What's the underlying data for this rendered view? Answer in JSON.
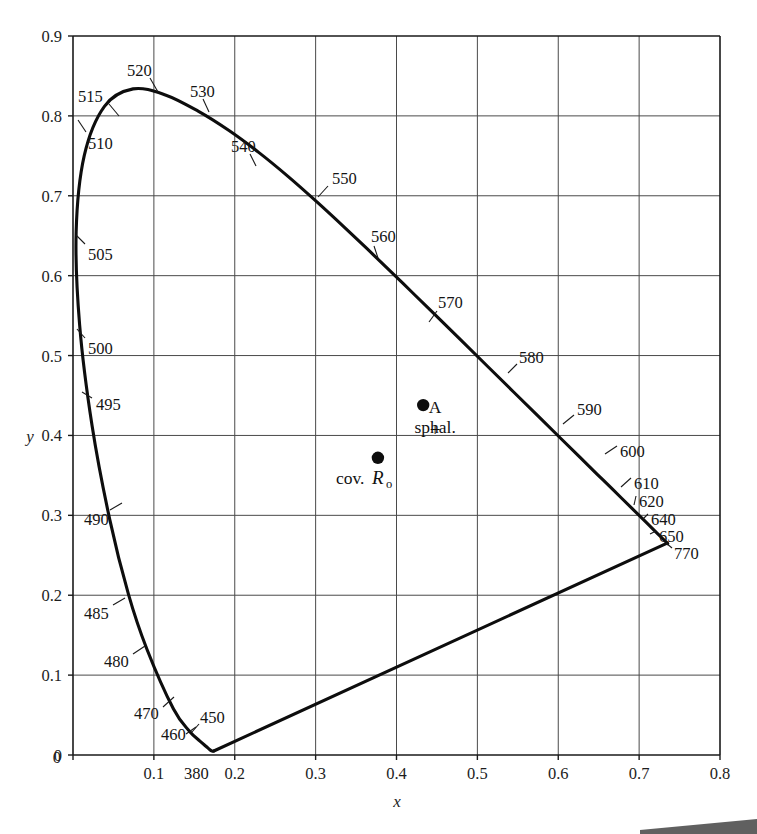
{
  "figure": {
    "kind": "cie-1931-chromaticity-diagram",
    "background_color": "#ffffff",
    "ink_color": "#0d0d0d",
    "grid_color": "#4a4a4a"
  },
  "axes": {
    "x_title": "x",
    "y_title": "y",
    "x_ticks": [
      "0",
      "0.1",
      "0.2",
      "0.3",
      "0.4",
      "0.5",
      "0.6",
      "0.7",
      "0.8"
    ],
    "x_tick_values": [
      0,
      0.1,
      0.2,
      0.3,
      0.4,
      0.5,
      0.6,
      0.7,
      0.8
    ],
    "y_ticks": [
      "0",
      "0.1",
      "0.2",
      "0.3",
      "0.4",
      "0.5",
      "0.6",
      "0.7",
      "0.8",
      "0.9"
    ],
    "y_tick_values": [
      0,
      0.1,
      0.2,
      0.3,
      0.4,
      0.5,
      0.6,
      0.7,
      0.8,
      0.9
    ],
    "x_origin_label": "0",
    "y_origin_label": "0",
    "xlim": [
      0,
      0.8
    ],
    "ylim": [
      0,
      0.9
    ],
    "grid": true
  },
  "chart_data": {
    "type": "line",
    "title": "",
    "subtitle": "",
    "xlabel": "x",
    "ylabel": "y",
    "xlim": [
      0,
      0.8
    ],
    "ylim": [
      0,
      0.9
    ],
    "grid": true,
    "legend_position": "none",
    "series": [
      {
        "name": "spectral-locus",
        "note": "CIE 1931 spectral locus, 380 nm to 770 nm",
        "points": [
          {
            "wavelength": 380,
            "x": 0.1741,
            "y": 0.005
          },
          {
            "wavelength": 390,
            "x": 0.1738,
            "y": 0.0049
          },
          {
            "wavelength": 400,
            "x": 0.1733,
            "y": 0.0048
          },
          {
            "wavelength": 410,
            "x": 0.1726,
            "y": 0.0048
          },
          {
            "wavelength": 420,
            "x": 0.1714,
            "y": 0.0051
          },
          {
            "wavelength": 430,
            "x": 0.1689,
            "y": 0.0069
          },
          {
            "wavelength": 440,
            "x": 0.1644,
            "y": 0.0109
          },
          {
            "wavelength": 450,
            "x": 0.1566,
            "y": 0.0177
          },
          {
            "wavelength": 460,
            "x": 0.144,
            "y": 0.0297
          },
          {
            "wavelength": 470,
            "x": 0.1241,
            "y": 0.0578
          },
          {
            "wavelength": 480,
            "x": 0.0913,
            "y": 0.1327
          },
          {
            "wavelength": 485,
            "x": 0.0687,
            "y": 0.2007
          },
          {
            "wavelength": 490,
            "x": 0.0454,
            "y": 0.295
          },
          {
            "wavelength": 495,
            "x": 0.0235,
            "y": 0.4127
          },
          {
            "wavelength": 500,
            "x": 0.0082,
            "y": 0.5384
          },
          {
            "wavelength": 505,
            "x": 0.0039,
            "y": 0.6548
          },
          {
            "wavelength": 510,
            "x": 0.0139,
            "y": 0.7502
          },
          {
            "wavelength": 515,
            "x": 0.0389,
            "y": 0.812
          },
          {
            "wavelength": 520,
            "x": 0.0743,
            "y": 0.8338
          },
          {
            "wavelength": 525,
            "x": 0.1142,
            "y": 0.8262
          },
          {
            "wavelength": 530,
            "x": 0.1547,
            "y": 0.8059
          },
          {
            "wavelength": 535,
            "x": 0.1929,
            "y": 0.7816
          },
          {
            "wavelength": 540,
            "x": 0.2296,
            "y": 0.7543
          },
          {
            "wavelength": 545,
            "x": 0.2658,
            "y": 0.7243
          },
          {
            "wavelength": 550,
            "x": 0.3016,
            "y": 0.6923
          },
          {
            "wavelength": 555,
            "x": 0.3373,
            "y": 0.6589
          },
          {
            "wavelength": 560,
            "x": 0.3731,
            "y": 0.6245
          },
          {
            "wavelength": 565,
            "x": 0.4087,
            "y": 0.5896
          },
          {
            "wavelength": 570,
            "x": 0.4441,
            "y": 0.5547
          },
          {
            "wavelength": 575,
            "x": 0.4788,
            "y": 0.5202
          },
          {
            "wavelength": 580,
            "x": 0.5125,
            "y": 0.4866
          },
          {
            "wavelength": 585,
            "x": 0.5448,
            "y": 0.4544
          },
          {
            "wavelength": 590,
            "x": 0.5752,
            "y": 0.4242
          },
          {
            "wavelength": 595,
            "x": 0.6029,
            "y": 0.3965
          },
          {
            "wavelength": 600,
            "x": 0.627,
            "y": 0.3725
          },
          {
            "wavelength": 605,
            "x": 0.6482,
            "y": 0.3514
          },
          {
            "wavelength": 610,
            "x": 0.6658,
            "y": 0.334
          },
          {
            "wavelength": 620,
            "x": 0.6915,
            "y": 0.3083
          },
          {
            "wavelength": 630,
            "x": 0.7079,
            "y": 0.292
          },
          {
            "wavelength": 640,
            "x": 0.719,
            "y": 0.2809
          },
          {
            "wavelength": 650,
            "x": 0.726,
            "y": 0.274
          },
          {
            "wavelength": 700,
            "x": 0.7347,
            "y": 0.2653
          },
          {
            "wavelength": 770,
            "x": 0.7347,
            "y": 0.2653
          }
        ]
      },
      {
        "name": "purple-line",
        "note": "line of purples, 770 nm back to 380 nm",
        "points": [
          {
            "x": 0.7347,
            "y": 0.2653
          },
          {
            "x": 0.1741,
            "y": 0.005
          }
        ]
      }
    ],
    "annotations": [
      {
        "label": "380",
        "x": 0.1741,
        "y": 0.005
      },
      {
        "label": "450",
        "x": 0.1566,
        "y": 0.0177
      },
      {
        "label": "460",
        "x": 0.144,
        "y": 0.0297
      },
      {
        "label": "470",
        "x": 0.1241,
        "y": 0.0578
      },
      {
        "label": "480",
        "x": 0.0913,
        "y": 0.1327
      },
      {
        "label": "485",
        "x": 0.0687,
        "y": 0.2007
      },
      {
        "label": "490",
        "x": 0.0454,
        "y": 0.295
      },
      {
        "label": "495",
        "x": 0.0235,
        "y": 0.4127
      },
      {
        "label": "500",
        "x": 0.0082,
        "y": 0.5384
      },
      {
        "label": "505",
        "x": 0.0039,
        "y": 0.6548
      },
      {
        "label": "510",
        "x": 0.0139,
        "y": 0.7502
      },
      {
        "label": "515",
        "x": 0.0389,
        "y": 0.812
      },
      {
        "label": "520",
        "x": 0.0743,
        "y": 0.8338
      },
      {
        "label": "530",
        "x": 0.1547,
        "y": 0.8059
      },
      {
        "label": "540",
        "x": 0.2296,
        "y": 0.7543
      },
      {
        "label": "550",
        "x": 0.3016,
        "y": 0.6923
      },
      {
        "label": "560",
        "x": 0.3731,
        "y": 0.6245
      },
      {
        "label": "570",
        "x": 0.4441,
        "y": 0.5547
      },
      {
        "label": "580",
        "x": 0.5125,
        "y": 0.4866
      },
      {
        "label": "590",
        "x": 0.5752,
        "y": 0.4242
      },
      {
        "label": "600",
        "x": 0.627,
        "y": 0.3725
      },
      {
        "label": "610",
        "x": 0.6658,
        "y": 0.334
      },
      {
        "label": "620",
        "x": 0.6915,
        "y": 0.3083
      },
      {
        "label": "640",
        "x": 0.719,
        "y": 0.2809
      },
      {
        "label": "650",
        "x": 0.726,
        "y": 0.274
      },
      {
        "label": "770",
        "x": 0.7347,
        "y": 0.2653
      }
    ],
    "data_points": [
      {
        "id": "illuminant-a",
        "label": "A",
        "marker": "plus",
        "x": 0.4476,
        "y": 0.4075
      },
      {
        "id": "sphalerite",
        "label": "sphal.",
        "marker": "dot",
        "x": 0.433,
        "y": 0.438
      },
      {
        "id": "covellite-ro",
        "label_prefix": "cov.",
        "label_italic": "R",
        "label_sub": "o",
        "marker": "dot",
        "x": 0.377,
        "y": 0.372
      }
    ]
  },
  "wavelength_labels": [
    {
      "text": "520",
      "lx": 127,
      "ly": 70,
      "l1x": 150,
      "l1y": 78,
      "l2x": 158,
      "l2y": 92
    },
    {
      "text": "515",
      "lx": 78,
      "ly": 96,
      "l1x": 109,
      "l1y": 104,
      "l2x": 119,
      "l2y": 116
    },
    {
      "text": "530",
      "lx": 190,
      "ly": 91,
      "l1x": 203,
      "l1y": 99,
      "l2x": 209,
      "l2y": 112
    },
    {
      "text": "510",
      "lx": 88,
      "ly": 143,
      "l1x": 86,
      "l1y": 132,
      "l2x": 78,
      "l2y": 120
    },
    {
      "text": "540",
      "lx": 231,
      "ly": 146,
      "l1x": 250,
      "l1y": 154,
      "l2x": 256,
      "l2y": 166
    },
    {
      "text": "550",
      "lx": 332,
      "ly": 178,
      "l1x": 328,
      "l1y": 186,
      "l2x": 318,
      "l2y": 197
    },
    {
      "text": "505",
      "lx": 88,
      "ly": 254,
      "l1x": 85,
      "l1y": 244,
      "l2x": 76,
      "l2y": 235
    },
    {
      "text": "560",
      "lx": 371,
      "ly": 236,
      "l1x": 374,
      "l1y": 246,
      "l2x": 378,
      "l2y": 258
    },
    {
      "text": "500",
      "lx": 88,
      "ly": 348,
      "l1x": 85,
      "l1y": 338,
      "l2x": 77,
      "l2y": 329
    },
    {
      "text": "570",
      "lx": 438,
      "ly": 302,
      "l1x": 437,
      "l1y": 311,
      "l2x": 429,
      "l2y": 322
    },
    {
      "text": "580",
      "lx": 519,
      "ly": 357,
      "l1x": 517,
      "l1y": 364,
      "l2x": 508,
      "l2y": 373
    },
    {
      "text": "495",
      "lx": 96,
      "ly": 404,
      "l1x": 92,
      "l1y": 398,
      "l2x": 82,
      "l2y": 392
    },
    {
      "text": "590",
      "lx": 577,
      "ly": 409,
      "l1x": 574,
      "l1y": 415,
      "l2x": 563,
      "l2y": 424
    },
    {
      "text": "600",
      "lx": 620,
      "ly": 451,
      "l1x": 617,
      "l1y": 446,
      "l2x": 605,
      "l2y": 454
    },
    {
      "text": "490",
      "lx": 84,
      "ly": 519,
      "l1x": 110,
      "l1y": 510,
      "l2x": 122,
      "l2y": 503
    },
    {
      "text": "610",
      "lx": 634,
      "ly": 483,
      "l1x": 631,
      "l1y": 478,
      "l2x": 621,
      "l2y": 487
    },
    {
      "text": "620",
      "lx": 639,
      "ly": 501,
      "l1x": 636,
      "l1y": 496,
      "l2x": 634,
      "l2y": 505
    },
    {
      "text": "640",
      "lx": 651,
      "ly": 519,
      "l1x": 648,
      "l1y": 514,
      "l2x": 643,
      "l2y": 519
    },
    {
      "text": "650",
      "lx": 659,
      "ly": 536,
      "l1x": 656,
      "l1y": 531,
      "l2x": 650,
      "l2y": 534
    },
    {
      "text": "485",
      "lx": 84,
      "ly": 613,
      "l1x": 113,
      "l1y": 605,
      "l2x": 125,
      "l2y": 598
    },
    {
      "text": "770",
      "lx": 674,
      "ly": 553,
      "l1x": 672,
      "l1y": 548,
      "l2x": 666,
      "l2y": 543
    },
    {
      "text": "480",
      "lx": 104,
      "ly": 661,
      "l1x": 133,
      "l1y": 654,
      "l2x": 145,
      "l2y": 646
    },
    {
      "text": "470",
      "lx": 134,
      "ly": 713,
      "l1x": 163,
      "l1y": 707,
      "l2x": 174,
      "l2y": 697
    },
    {
      "text": "450",
      "lx": 200,
      "ly": 717,
      "l1x": 199,
      "l1y": 724,
      "l2x": 192,
      "l2y": 732
    },
    {
      "text": "460",
      "lx": 161,
      "ly": 734,
      "l1x": 186,
      "l1y": 734,
      "l2x": 196,
      "l2y": 727
    },
    {
      "text": "380",
      "lx": 184,
      "ly": 773,
      "l1x": 0,
      "l1y": 0,
      "l2x": 0,
      "l2y": 0
    }
  ]
}
